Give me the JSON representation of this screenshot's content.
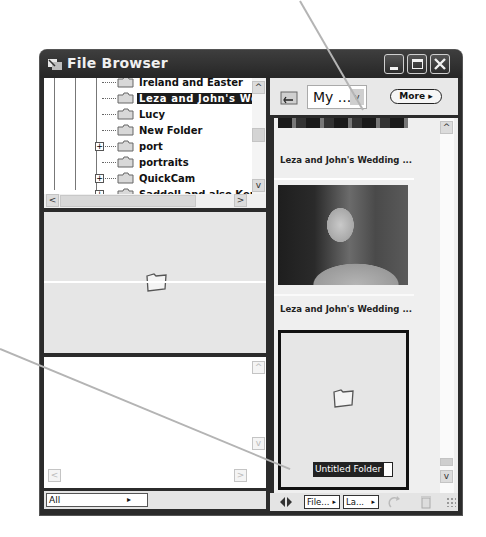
{
  "window": {
    "title": "File Browser",
    "controls": [
      "minimize",
      "maximize",
      "close"
    ]
  },
  "folder_tree": {
    "items": [
      {
        "label": "Ireland and Easter",
        "expandable": false,
        "selected": false
      },
      {
        "label": "Leza and John's We",
        "expandable": false,
        "selected": true
      },
      {
        "label": "Lucy",
        "expandable": false,
        "selected": false
      },
      {
        "label": "New Folder",
        "expandable": false,
        "selected": false
      },
      {
        "label": "port",
        "expandable": true,
        "selected": false
      },
      {
        "label": "portraits",
        "expandable": false,
        "selected": false
      },
      {
        "label": "QuickCam",
        "expandable": true,
        "selected": false
      },
      {
        "label": "Saddell and also Kerrie",
        "expandable": true,
        "selected": false
      }
    ],
    "expander_glyph": "+"
  },
  "preview": {
    "icon": "folder-icon"
  },
  "left_status": {
    "filter_value": "All"
  },
  "toolbar": {
    "location_value": "My ...",
    "more_label": "More",
    "more_arrow": "▸"
  },
  "thumbnails": [
    {
      "caption": "Leza and John's Wedding ...",
      "type": "image"
    },
    {
      "caption": "Leza and John's Wedding ...",
      "type": "image"
    },
    {
      "caption": "Untitled Folder",
      "type": "folder",
      "selected": true,
      "renaming": true
    }
  ],
  "right_status": {
    "sort_label": "File...",
    "view_label": "La...",
    "arrow": "▸"
  },
  "scroll_glyphs": {
    "up": "^",
    "down": "v",
    "left": "<",
    "right": ">"
  },
  "colors": {
    "titlebar": "#2b2b2b",
    "selection": "#1c1c1c",
    "panel_bg": "#e6e6e6",
    "callout_line": "#b4b4b4"
  }
}
